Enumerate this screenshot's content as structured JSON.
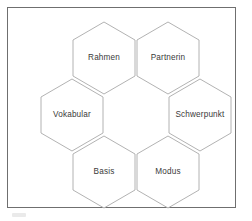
{
  "page": {
    "background_color": "#ffffff",
    "frame": {
      "border_color": "#6f6f6f",
      "fill_color": "#ffffff"
    }
  },
  "diagram": {
    "type": "honeycomb-ring",
    "hex_fill": "#ffffff",
    "hex_stroke": "#a9a9a9",
    "label_color": "#3a3a3a",
    "center_is_empty": true,
    "cells": [
      {
        "id": "rahmen",
        "label": "Rahmen",
        "position": "top-left",
        "cx": 104,
        "cy": 53
      },
      {
        "id": "partnerin",
        "label": "Partnerin",
        "position": "top-right",
        "cx": 168,
        "cy": 53
      },
      {
        "id": "vokabular",
        "label": "Vokabular",
        "position": "middle-left",
        "cx": 72,
        "cy": 110
      },
      {
        "id": "schwerpunkt",
        "label": "Schwerpunkt",
        "position": "middle-right",
        "cx": 200,
        "cy": 110
      },
      {
        "id": "basis",
        "label": "Basis",
        "position": "bottom-left",
        "cx": 104,
        "cy": 167
      },
      {
        "id": "modus",
        "label": "Modus",
        "position": "bottom-right",
        "cx": 168,
        "cy": 167
      }
    ]
  }
}
